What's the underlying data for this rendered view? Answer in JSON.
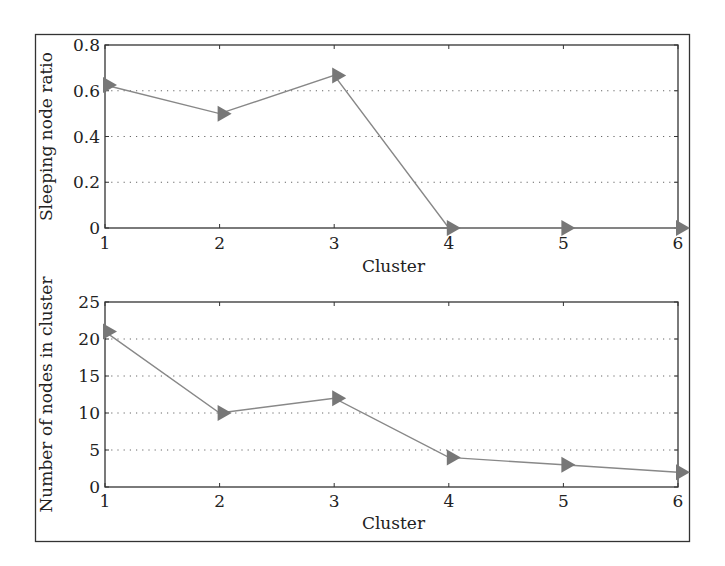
{
  "figure": {
    "border_color": "#333333",
    "line_color": "#888888",
    "marker_color": "#777777",
    "grid_color": "#666666"
  },
  "chart_data": [
    {
      "type": "line",
      "title": "",
      "xlabel": "Cluster",
      "ylabel": "Sleeping node ratio",
      "x": [
        1,
        2,
        3,
        4,
        5,
        6
      ],
      "series": [
        {
          "name": "Sleeping node ratio",
          "values": [
            0.625,
            0.5,
            0.667,
            0,
            0,
            0
          ],
          "marker": "triangle-right"
        }
      ],
      "xlim": [
        1,
        6
      ],
      "ylim": [
        0,
        0.8
      ],
      "xticks": [
        "1",
        "2",
        "3",
        "4",
        "5",
        "6"
      ],
      "yticks": [
        "0",
        "0.2",
        "0.4",
        "0.6",
        "0.8"
      ],
      "ytick_values": [
        0,
        0.2,
        0.4,
        0.6,
        0.8
      ],
      "grid": "horizontal-dotted",
      "legend": "none"
    },
    {
      "type": "line",
      "title": "",
      "xlabel": "Cluster",
      "ylabel": "Number of nodes in cluster",
      "x": [
        1,
        2,
        3,
        4,
        5,
        6
      ],
      "series": [
        {
          "name": "Number of nodes in cluster",
          "values": [
            21,
            10,
            12,
            4,
            3,
            2
          ],
          "marker": "triangle-right"
        }
      ],
      "xlim": [
        1,
        6
      ],
      "ylim": [
        0,
        25
      ],
      "xticks": [
        "1",
        "2",
        "3",
        "4",
        "5",
        "6"
      ],
      "yticks": [
        "0",
        "5",
        "10",
        "15",
        "20",
        "25"
      ],
      "ytick_values": [
        0,
        5,
        10,
        15,
        20,
        25
      ],
      "grid": "horizontal-dotted",
      "legend": "none"
    }
  ]
}
